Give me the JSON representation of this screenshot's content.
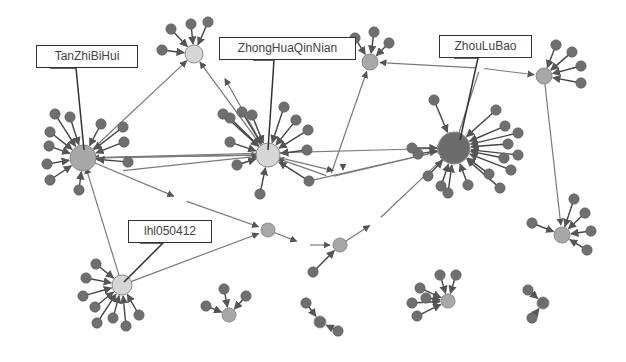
{
  "diagram": {
    "type": "directed-network-graph",
    "colors": {
      "background": "#ffffff",
      "leaf_node": "#6f6f6f",
      "leaf_stroke": "#5a5a5a",
      "hub_light": "#d6d6d6",
      "hub_light_stroke": "#8a8a8a",
      "hub_mid": "#a8a8a8",
      "hub_dark": "#6c6c6c",
      "edge": "#7a7a7a",
      "edge_dark": "#444444",
      "callout_border": "#333333",
      "callout_text": "#444444"
    },
    "labels": [
      {
        "id": "TanZhiBiHui",
        "text": "TanZhiBiHui",
        "box": [
          36,
          45,
          102,
          23
        ],
        "pointer": [
          [
            50,
            68
          ],
          [
            76,
            68
          ],
          [
            84,
            150
          ]
        ]
      },
      {
        "id": "ZhongHuaQinNian",
        "text": "ZhongHuaQinNian",
        "box": [
          219,
          37,
          137,
          23
        ],
        "pointer": [
          [
            253,
            60
          ],
          [
            274,
            60
          ],
          [
            268,
            150
          ]
        ]
      },
      {
        "id": "ZhouLuBao",
        "text": "ZhouLuBao",
        "box": [
          439,
          35,
          93,
          23
        ],
        "pointer": [
          [
            454,
            58
          ],
          [
            478,
            58
          ],
          [
            460,
            140
          ]
        ]
      },
      {
        "id": "lhl050412",
        "text": "lhl050412",
        "box": [
          128,
          220,
          84,
          23
        ],
        "pointer": [
          [
            140,
            243
          ],
          [
            163,
            243
          ],
          [
            124,
            282
          ]
        ]
      }
    ],
    "hubs": [
      {
        "id": "TanZhiBiHui",
        "x": 83,
        "y": 158,
        "r": 13,
        "tone": "mid"
      },
      {
        "id": "ZhongHuaQinNian",
        "x": 268,
        "y": 155,
        "r": 12,
        "tone": "light"
      },
      {
        "id": "ZhouLuBao",
        "x": 454,
        "y": 148,
        "r": 16,
        "tone": "dark"
      },
      {
        "id": "lhl050412",
        "x": 122,
        "y": 285,
        "r": 10,
        "tone": "light"
      },
      {
        "id": "hub-top-left",
        "x": 194,
        "y": 54,
        "r": 9,
        "tone": "light"
      },
      {
        "id": "hub-top-mid",
        "x": 370,
        "y": 62,
        "r": 8,
        "tone": "mid"
      },
      {
        "id": "hub-top-right",
        "x": 544,
        "y": 76,
        "r": 8,
        "tone": "mid"
      },
      {
        "id": "hub-right-mid",
        "x": 562,
        "y": 235,
        "r": 8,
        "tone": "mid"
      },
      {
        "id": "hub-mid-a",
        "x": 268,
        "y": 230,
        "r": 7,
        "tone": "mid"
      },
      {
        "id": "hub-mid-b",
        "x": 340,
        "y": 245,
        "r": 7,
        "tone": "mid"
      },
      {
        "id": "hub-bottom-left",
        "x": 229,
        "y": 315,
        "r": 7,
        "tone": "mid"
      },
      {
        "id": "hub-bottom-mid",
        "x": 448,
        "y": 301,
        "r": 7,
        "tone": "mid"
      },
      {
        "id": "hub-bottom-right",
        "x": 543,
        "y": 303,
        "r": 6,
        "tone": "dark"
      },
      {
        "id": "hub-bottom-chain",
        "x": 320,
        "y": 322,
        "r": 6,
        "tone": "dark"
      }
    ],
    "leaves": [
      {
        "hub": "TanZhiBiHui",
        "pts": [
          [
            55,
            114
          ],
          [
            70,
            117
          ],
          [
            50,
            132
          ],
          [
            49,
            146
          ],
          [
            47,
            164
          ],
          [
            50,
            180
          ],
          [
            79,
            190
          ],
          [
            101,
            124
          ],
          [
            123,
            127
          ],
          [
            124,
            142
          ],
          [
            128,
            162
          ]
        ]
      },
      {
        "hub": "ZhongHuaQinNian",
        "pts": [
          [
            230,
            118
          ],
          [
            242,
            112
          ],
          [
            252,
            115
          ],
          [
            284,
            107
          ],
          [
            296,
            120
          ],
          [
            308,
            130
          ],
          [
            307,
            150
          ],
          [
            309,
            181
          ],
          [
            230,
            142
          ],
          [
            237,
            165
          ],
          [
            260,
            194
          ],
          [
            223,
            114
          ]
        ]
      },
      {
        "hub": "ZhouLuBao",
        "pts": [
          [
            434,
            100
          ],
          [
            496,
            110
          ],
          [
            505,
            126
          ],
          [
            518,
            133
          ],
          [
            508,
            144
          ],
          [
            518,
            155
          ],
          [
            504,
            158
          ],
          [
            511,
            170
          ],
          [
            489,
            174
          ],
          [
            468,
            185
          ],
          [
            441,
            186
          ],
          [
            428,
            176
          ],
          [
            418,
            154
          ],
          [
            412,
            148
          ],
          [
            448,
            193
          ],
          [
            500,
            188
          ]
        ]
      },
      {
        "hub": "lhl050412",
        "pts": [
          [
            96,
            264
          ],
          [
            86,
            278
          ],
          [
            83,
            296
          ],
          [
            95,
            307
          ],
          [
            97,
            323
          ],
          [
            113,
            318
          ],
          [
            126,
            326
          ],
          [
            139,
            315
          ]
        ]
      },
      {
        "hub": "hub-top-left",
        "pts": [
          [
            162,
            50
          ],
          [
            171,
            29
          ],
          [
            191,
            24
          ],
          [
            208,
            22
          ]
        ]
      },
      {
        "hub": "hub-top-mid",
        "pts": [
          [
            355,
            38
          ],
          [
            374,
            32
          ],
          [
            389,
            43
          ]
        ]
      },
      {
        "hub": "hub-top-right",
        "pts": [
          [
            556,
            45
          ],
          [
            572,
            52
          ],
          [
            581,
            66
          ],
          [
            581,
            83
          ]
        ]
      },
      {
        "hub": "hub-right-mid",
        "pts": [
          [
            532,
            223
          ],
          [
            574,
            199
          ],
          [
            585,
            213
          ],
          [
            591,
            231
          ],
          [
            587,
            250
          ]
        ]
      },
      {
        "hub": "hub-bottom-left",
        "pts": [
          [
            206,
            306
          ],
          [
            224,
            289
          ],
          [
            246,
            296
          ]
        ]
      },
      {
        "hub": "hub-bottom-mid",
        "pts": [
          [
            420,
            288
          ],
          [
            426,
            298
          ],
          [
            412,
            303
          ],
          [
            417,
            316
          ],
          [
            440,
            275
          ],
          [
            456,
            275
          ]
        ]
      },
      {
        "hub": "hub-bottom-right",
        "pts": [
          [
            528,
            290
          ],
          [
            532,
            318
          ]
        ]
      },
      {
        "hub": "hub-bottom-chain",
        "pts": [
          [
            306,
            303
          ],
          [
            338,
            331
          ]
        ]
      },
      {
        "hub": "hub-mid-b",
        "pts": [
          [
            313,
            272
          ]
        ]
      }
    ],
    "links": [
      [
        [
          83,
          158
        ],
        [
          194,
          54
        ]
      ],
      [
        [
          83,
          158
        ],
        [
          268,
          155
        ]
      ],
      [
        [
          268,
          155
        ],
        [
          83,
          158
        ]
      ],
      [
        [
          119,
          171
        ],
        [
          268,
          155
        ]
      ],
      [
        [
          83,
          158
        ],
        [
          454,
          148
        ]
      ],
      [
        [
          122,
          285
        ],
        [
          83,
          158
        ]
      ],
      [
        [
          122,
          285
        ],
        [
          268,
          230
        ]
      ],
      [
        [
          83,
          158
        ],
        [
          183,
          200
        ]
      ],
      [
        [
          183,
          200
        ],
        [
          268,
          230
        ]
      ],
      [
        [
          268,
          155
        ],
        [
          194,
          54
        ]
      ],
      [
        [
          268,
          155
        ],
        [
          220,
          70
        ]
      ],
      [
        [
          309,
          181
        ],
        [
          454,
          148
        ]
      ],
      [
        [
          330,
          177
        ],
        [
          454,
          148
        ]
      ],
      [
        [
          330,
          177
        ],
        [
          268,
          155
        ]
      ],
      [
        [
          330,
          177
        ],
        [
          370,
          62
        ]
      ],
      [
        [
          370,
          62
        ],
        [
          374,
          62
        ]
      ],
      [
        [
          480,
          68
        ],
        [
          370,
          62
        ]
      ],
      [
        [
          480,
          68
        ],
        [
          544,
          76
        ]
      ],
      [
        [
          480,
          68
        ],
        [
          454,
          148
        ]
      ],
      [
        [
          544,
          76
        ],
        [
          562,
          235
        ]
      ],
      [
        [
          268,
          230
        ],
        [
          306,
          245
        ]
      ],
      [
        [
          306,
          245
        ],
        [
          340,
          245
        ]
      ],
      [
        [
          340,
          245
        ],
        [
          378,
          220
        ]
      ],
      [
        [
          378,
          220
        ],
        [
          454,
          148
        ]
      ],
      [
        [
          343,
          173
        ],
        [
          343,
          160
        ]
      ],
      [
        [
          268,
          155
        ],
        [
          343,
          173
        ]
      ]
    ]
  }
}
